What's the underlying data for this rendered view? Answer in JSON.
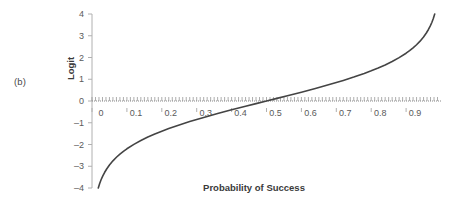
{
  "figure": {
    "panel_label": "(b)"
  },
  "chart_data": {
    "type": "line",
    "title": "",
    "subtitle": "",
    "xlabel": "Probability of Success",
    "ylabel": "Logit",
    "xlim": [
      0,
      1.0
    ],
    "ylim": [
      -4,
      4
    ],
    "grid": false,
    "legend": null,
    "zero_line": true,
    "zero_line_style": "dotted",
    "x_tick_labels": [
      "0",
      "0.1",
      "0.2",
      "0.3",
      "0.4",
      "0.5",
      "0.6",
      "0.7",
      "0.8",
      "0.9"
    ],
    "x_tick_values": [
      0,
      0.1,
      0.2,
      0.3,
      0.4,
      0.5,
      0.6,
      0.7,
      0.8,
      0.9
    ],
    "x_minor_tick_step": 0.01,
    "y_tick_labels": [
      "4",
      "3",
      "2",
      "1",
      "0",
      "-1",
      "-2",
      "-3",
      "-4"
    ],
    "y_tick_values": [
      4,
      3,
      2,
      1,
      0,
      -1,
      -2,
      -3,
      -4
    ],
    "series": [
      {
        "name": "logit",
        "formula": "ln(p/(1-p))",
        "color": "#444444",
        "line_width": 1.6,
        "x": [
          0.018,
          0.022,
          0.026,
          0.031,
          0.036,
          0.042,
          0.05,
          0.06,
          0.07,
          0.08,
          0.09,
          0.1,
          0.12,
          0.14,
          0.16,
          0.18,
          0.2,
          0.22,
          0.25,
          0.28,
          0.3,
          0.33,
          0.36,
          0.4,
          0.44,
          0.47,
          0.5,
          0.53,
          0.56,
          0.6,
          0.64,
          0.67,
          0.7,
          0.72,
          0.75,
          0.78,
          0.8,
          0.82,
          0.84,
          0.86,
          0.88,
          0.9,
          0.91,
          0.92,
          0.93,
          0.94,
          0.95,
          0.958,
          0.964,
          0.969,
          0.974,
          0.978,
          0.982
        ],
        "y": [
          -3.997,
          -3.793,
          -3.621,
          -3.441,
          -3.288,
          -3.127,
          -2.944,
          -2.752,
          -2.586,
          -2.442,
          -2.314,
          -2.197,
          -1.992,
          -1.815,
          -1.658,
          -1.516,
          -1.386,
          -1.266,
          -1.099,
          -0.944,
          -0.847,
          -0.708,
          -0.575,
          -0.405,
          -0.241,
          -0.12,
          0.0,
          0.12,
          0.241,
          0.405,
          0.575,
          0.708,
          0.847,
          0.944,
          1.099,
          1.266,
          1.386,
          1.516,
          1.658,
          1.815,
          1.992,
          2.197,
          2.314,
          2.442,
          2.586,
          2.752,
          2.944,
          3.127,
          3.288,
          3.441,
          3.621,
          3.793,
          3.997
        ]
      }
    ]
  },
  "colors": {
    "curve": "#444444",
    "axis": "#b0b0b0",
    "tick_text": "#5a5a5a",
    "label_text": "#3a3a3a",
    "background": "#ffffff"
  }
}
